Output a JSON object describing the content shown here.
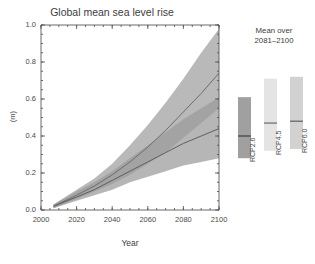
{
  "chart_data": {
    "type": "area",
    "title": "Global mean sea level rise",
    "xlabel": "Year",
    "ylabel": "(m)",
    "xlim": [
      2000,
      2100
    ],
    "ylim": [
      0.0,
      1.0
    ],
    "grid": false,
    "legend_position": "right-panel",
    "x_ticks": [
      2000,
      2020,
      2040,
      2060,
      2080,
      2100
    ],
    "x_tick_labels": [
      "2000",
      "2020",
      "2040",
      "2060",
      "2080",
      "2100"
    ],
    "x_minor_tick_step": 5,
    "y_ticks": [
      0.0,
      0.2,
      0.4,
      0.6,
      0.8,
      1.0
    ],
    "y_tick_labels": [
      "0.0",
      "0.2",
      "0.4",
      "0.6",
      "0.8",
      "1.0"
    ],
    "y_minor_tick_step": 0.05,
    "x": [
      2007,
      2020,
      2030,
      2040,
      2050,
      2060,
      2070,
      2080,
      2090,
      2100
    ],
    "series": [
      {
        "name": "RCP8.5",
        "color": "#b9b9b9",
        "line_color": "#6d6d6d",
        "median": [
          0.02,
          0.08,
          0.13,
          0.19,
          0.26,
          0.34,
          0.43,
          0.53,
          0.63,
          0.74
        ],
        "lower": [
          0.01,
          0.06,
          0.1,
          0.14,
          0.19,
          0.25,
          0.31,
          0.39,
          0.47,
          0.55
        ],
        "upper": [
          0.03,
          0.11,
          0.17,
          0.25,
          0.35,
          0.46,
          0.58,
          0.71,
          0.85,
          0.98
        ]
      },
      {
        "name": "RCP2.6",
        "color": "#9a9a9a",
        "line_color": "#5e5e5e",
        "median": [
          0.02,
          0.07,
          0.11,
          0.16,
          0.21,
          0.26,
          0.31,
          0.36,
          0.4,
          0.44
        ],
        "lower": [
          0.01,
          0.05,
          0.08,
          0.11,
          0.15,
          0.18,
          0.21,
          0.24,
          0.26,
          0.28
        ],
        "upper": [
          0.03,
          0.1,
          0.15,
          0.21,
          0.28,
          0.35,
          0.42,
          0.49,
          0.55,
          0.61
        ]
      }
    ]
  },
  "side_panel": {
    "title_line1": "Mean over",
    "title_line2": "2081–2100",
    "bars": [
      {
        "label": "RCP2.6",
        "low": 0.28,
        "high": 0.61,
        "median": 0.4,
        "color": "#a0a0a0",
        "line_color": "#3f3f3f"
      },
      {
        "label": "RCP4.5",
        "low": 0.32,
        "high": 0.71,
        "median": 0.47,
        "color": "#e4e4e4",
        "line_color": "#6a6a6a"
      },
      {
        "label": "RCP6.0",
        "low": 0.33,
        "high": 0.72,
        "median": 0.48,
        "color": "#d2d2d2",
        "line_color": "#5e5e5e"
      },
      {
        "label": "RCP8.5",
        "low": 0.45,
        "high": 0.98,
        "median": 0.63,
        "color": "#9b9b9b",
        "line_color": "#3b3b3b"
      }
    ]
  },
  "colors": {
    "background": "#ffffff",
    "axis": "#5a5a5a",
    "text": "#474747",
    "band_outer": "#b9b9b9",
    "band_inner": "#9a9a9a",
    "band_overlap": "#8a8a8a"
  }
}
